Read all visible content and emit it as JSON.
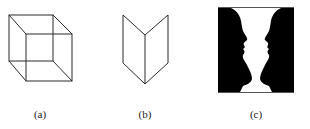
{
  "figures": [
    {
      "id": "a",
      "label": "(a)",
      "name": "necker-cube"
    },
    {
      "id": "b",
      "label": "(b)",
      "name": "mach-book"
    },
    {
      "id": "c",
      "label": "(c)",
      "name": "rubin-vase"
    }
  ],
  "colors": {
    "stroke": "#2a2a2a",
    "fill": "#000000",
    "background": "#ffffff"
  }
}
